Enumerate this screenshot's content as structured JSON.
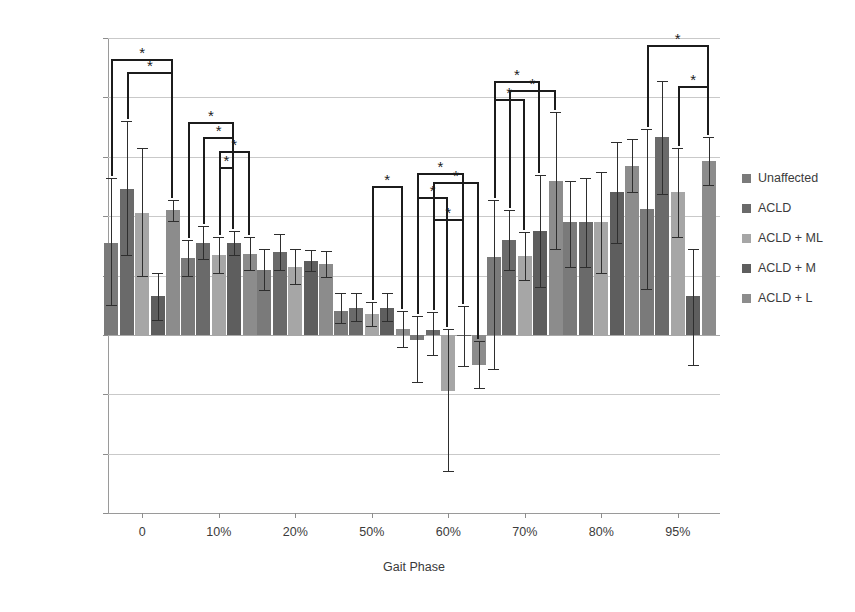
{
  "chart_data": {
    "type": "bar",
    "title": "",
    "xlabel": "Gait Phase",
    "ylabel": "Knee Rotation Moment Nm/Kg·m",
    "ylim": [
      -0.03,
      0.05
    ],
    "ytick_labels": [
      "0.05",
      "0.04",
      "0.03",
      "0.02",
      "0.01",
      "0",
      "-0.01",
      "-0.02",
      "-0.03"
    ],
    "ytick_values": [
      0.05,
      0.04,
      0.03,
      0.02,
      0.01,
      0,
      -0.01,
      -0.02,
      -0.03
    ],
    "grid": true,
    "legend_position": "right",
    "categories": [
      "0",
      "10%",
      "20%",
      "50%",
      "60%",
      "70%",
      "80%",
      "95%"
    ],
    "series": [
      {
        "name": "Unaffected",
        "color": "#7a7a7a",
        "values": [
          0.0155,
          0.013,
          0.011,
          0.004,
          -0.0008,
          0.0132,
          0.019,
          0.0212
        ],
        "err_up": [
          0.011,
          0.003,
          0.0035,
          0.003,
          0.004,
          0.0095,
          0.007,
          0.0135
        ],
        "err_dn": [
          0.0105,
          0.003,
          0.0035,
          0.002,
          0.0072,
          0.019,
          0.0075,
          0.0135
        ]
      },
      {
        "name": "ACLD",
        "color": "#6a6a6a",
        "values": [
          0.0245,
          0.0155,
          0.014,
          0.0045,
          0.0008,
          0.016,
          0.019,
          0.0333
        ],
        "err_up": [
          0.0115,
          0.0028,
          0.003,
          0.0025,
          0.003,
          0.005,
          0.0075,
          0.0095
        ],
        "err_dn": [
          0.011,
          0.0028,
          0.003,
          0.0022,
          0.0042,
          0.005,
          0.0075,
          0.0095
        ]
      },
      {
        "name": "ACLD + ML",
        "color": "#a6a6a6",
        "values": [
          0.0205,
          0.0135,
          0.0115,
          0.0035,
          -0.0095,
          0.0133,
          0.019,
          0.024
        ],
        "err_up": [
          0.011,
          0.003,
          0.003,
          0.002,
          0.0105,
          0.004,
          0.0085,
          0.0075
        ],
        "err_dn": [
          0.0105,
          0.003,
          0.003,
          0.002,
          0.0135,
          0.004,
          0.0085,
          0.0075
        ]
      },
      {
        "name": "ACLD + M",
        "color": "#5e5e5e",
        "values": [
          0.0065,
          0.0155,
          0.0125,
          0.0045,
          -0.0002,
          0.0175,
          0.024,
          0.0065
        ],
        "err_up": [
          0.004,
          0.002,
          0.0018,
          0.0025,
          0.005,
          0.0095,
          0.0085,
          0.008
        ],
        "err_dn": [
          0.004,
          0.002,
          0.0018,
          0.0022,
          0.005,
          0.0095,
          0.0085,
          0.0115
        ]
      },
      {
        "name": "ACLD + L",
        "color": "#8c8c8c",
        "values": [
          0.021,
          0.0137,
          0.012,
          0.001,
          -0.005,
          0.026,
          0.0285,
          0.0293
        ],
        "err_up": [
          0.0018,
          0.0028,
          0.0022,
          0.003,
          0.004,
          0.0115,
          0.0045,
          0.004
        ],
        "err_dn": [
          0.0018,
          0.0028,
          0.0022,
          0.003,
          0.004,
          0.0115,
          0.0045,
          0.004
        ]
      }
    ],
    "significance_marker": "*",
    "significance_brackets": [
      {
        "group": "0",
        "from": 0,
        "to": 4,
        "y": 0.0465
      },
      {
        "group": "0",
        "from": 1,
        "to": 4,
        "y": 0.0442
      },
      {
        "group": "10%",
        "from": 0,
        "to": 3,
        "y": 0.0358
      },
      {
        "group": "10%",
        "from": 1,
        "to": 3,
        "y": 0.0333
      },
      {
        "group": "10%",
        "from": 2,
        "to": 4,
        "y": 0.031
      },
      {
        "group": "10%",
        "from": 2,
        "to": 3,
        "y": 0.0283
      },
      {
        "group": "50%",
        "from": 2,
        "to": 4,
        "y": 0.025
      },
      {
        "group": "60%",
        "from": 0,
        "to": 3,
        "y": 0.0272
      },
      {
        "group": "60%",
        "from": 1,
        "to": 4,
        "y": 0.0258
      },
      {
        "group": "60%",
        "from": 0,
        "to": 2,
        "y": 0.0232
      },
      {
        "group": "60%",
        "from": 1,
        "to": 3,
        "y": 0.0196
      },
      {
        "group": "70%",
        "from": 0,
        "to": 3,
        "y": 0.0428
      },
      {
        "group": "70%",
        "from": 1,
        "to": 4,
        "y": 0.0413
      },
      {
        "group": "70%",
        "from": 0,
        "to": 2,
        "y": 0.0398
      },
      {
        "group": "95%",
        "from": 0,
        "to": 4,
        "y": 0.0488
      },
      {
        "group": "95%",
        "from": 2,
        "to": 4,
        "y": 0.042
      }
    ]
  },
  "legend": {
    "items": [
      {
        "label": "Unaffected",
        "color": "#7a7a7a"
      },
      {
        "label": "ACLD",
        "color": "#6a6a6a"
      },
      {
        "label": "ACLD + ML",
        "color": "#a6a6a6"
      },
      {
        "label": "ACLD + M",
        "color": "#5e5e5e"
      },
      {
        "label": "ACLD + L",
        "color": "#8c8c8c"
      }
    ]
  }
}
